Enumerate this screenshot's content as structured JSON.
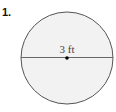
{
  "problem": {
    "number": "1.",
    "diameter_label": "3 ft"
  },
  "figure": {
    "shape": "circle",
    "fill": "#f2f2f2",
    "stroke": "#555555",
    "center": [
      67,
      58
    ],
    "radius": 46,
    "segment": "diameter"
  }
}
